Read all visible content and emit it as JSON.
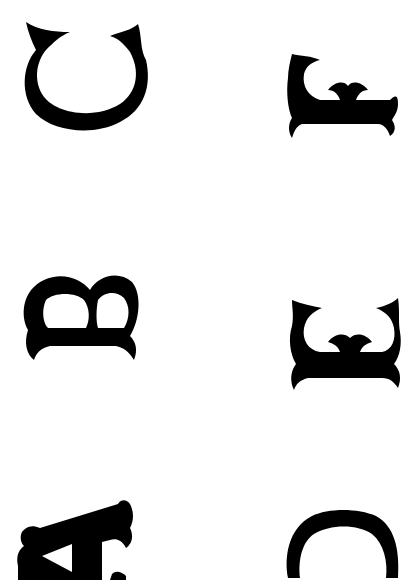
{
  "page": {
    "background": "#ffffff",
    "ink": "#000000"
  },
  "letters": [
    {
      "char": "C",
      "column": "left",
      "row": 1,
      "rotation": "90deg"
    },
    {
      "char": "F",
      "column": "right",
      "row": 1,
      "rotation": "90deg"
    },
    {
      "char": "B",
      "column": "left",
      "row": 2,
      "rotation": "90deg"
    },
    {
      "char": "E",
      "column": "right",
      "row": 2,
      "rotation": "90deg"
    },
    {
      "char": "A",
      "column": "left",
      "row": 3,
      "rotation": "90deg"
    },
    {
      "char": "D",
      "column": "right",
      "row": 3,
      "rotation": "90deg"
    }
  ]
}
